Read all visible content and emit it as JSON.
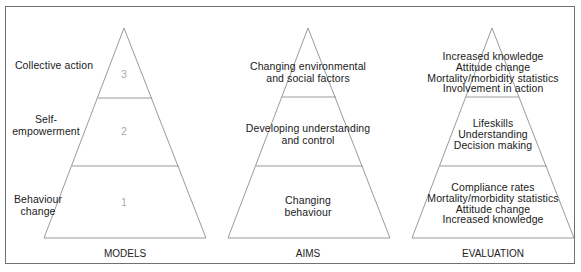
{
  "diagram": {
    "colors": {
      "frame": "#707070",
      "lines": "#9a9a9a",
      "text": "#1a1a1a",
      "numbers": "#a8a8a8"
    },
    "pyramids": [
      {
        "caption": "MODELS",
        "levels": [
          {
            "number": "3",
            "label_line1": "Collective action",
            "label_line2": ""
          },
          {
            "number": "2",
            "label_line1": "Self-",
            "label_line2": "empowerment"
          },
          {
            "number": "1",
            "label_line1": "Behaviour",
            "label_line2": "change"
          }
        ]
      },
      {
        "caption": "AIMS",
        "levels": [
          {
            "line1": "Changing environmental",
            "line2": "and social factors"
          },
          {
            "line1": "Developing understanding",
            "line2": "and control"
          },
          {
            "line1": "Changing",
            "line2": "behaviour"
          }
        ]
      },
      {
        "caption": "EVALUATION",
        "levels": [
          {
            "lines": [
              "Increased knowledge",
              "Attitude change",
              "Mortality/morbidity statistics",
              "Involvement in action"
            ]
          },
          {
            "lines": [
              "Lifeskills",
              "Understanding",
              "Decision making"
            ]
          },
          {
            "lines": [
              "Compliance rates",
              "Mortality/morbidity statistics",
              "Attitude change",
              "Increased knowledge"
            ]
          }
        ]
      }
    ]
  }
}
